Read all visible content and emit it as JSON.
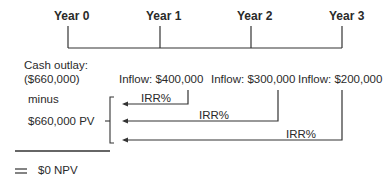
{
  "timeline": {
    "years": [
      "Year 0",
      "Year 1",
      "Year 2",
      "Year 3"
    ]
  },
  "cashflows": {
    "outlay_label": "Cash outlay:",
    "outlay_value": "($660,000)",
    "inflows": [
      "Inflow: $400,000",
      "Inflow: $300,000",
      "Inflow: $200,000"
    ]
  },
  "discounting": {
    "rate_labels": [
      "IRR%",
      "IRR%",
      "IRR%"
    ],
    "minus_label": "minus",
    "pv_label": "$660,000 PV"
  },
  "result": {
    "equals_symbol": "=",
    "npv_label": "$0 NPV"
  },
  "colors": {
    "line": "#333333",
    "text": "#2a2a2a"
  }
}
